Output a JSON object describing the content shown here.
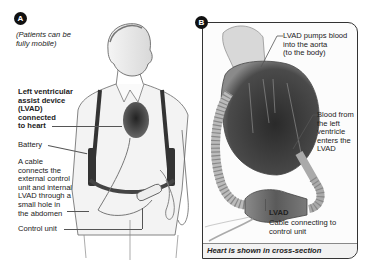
{
  "panel_a": {
    "badge": "A",
    "caption": "(Patients can be fully mobile)",
    "caption_lines": [
      "(Patients can be",
      "fully mobile)"
    ],
    "labels": {
      "lvad_connected": [
        "Left ventricular",
        "assist device",
        "(LVAD)",
        "connected",
        "to heart"
      ],
      "battery": "Battery",
      "cable": [
        "A cable",
        "connects the",
        "external control",
        "unit and internal",
        "LVAD through a",
        "small hole in",
        "the abdomen"
      ],
      "control_unit": "Control unit"
    }
  },
  "panel_b": {
    "badge": "B",
    "labels": {
      "pumps": [
        "LVAD pumps blood",
        "into the aorta",
        "(to the body)"
      ],
      "blood_from": [
        "Blood from",
        "the left",
        "ventricle",
        "enters the",
        "LVAD"
      ],
      "lvad": "LVAD",
      "cable_connecting": [
        "Cable connecting to",
        "control unit"
      ]
    },
    "footer": "Heart is shown in cross-section"
  },
  "colors": {
    "badge": "#111111",
    "heart_dark": "#3a3a3a",
    "line": "#555555",
    "skin": "#e6e6e6"
  }
}
